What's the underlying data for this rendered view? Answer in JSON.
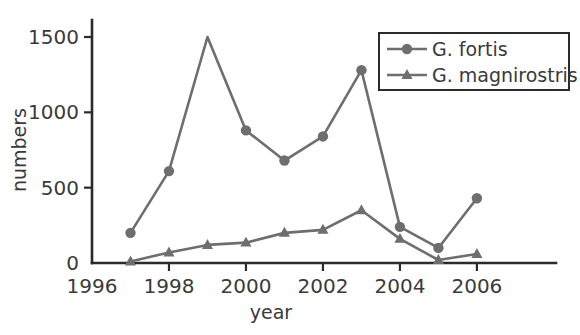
{
  "chart_data": {
    "type": "line",
    "title": "",
    "xlabel": "year",
    "ylabel": "numbers",
    "x": [
      1997,
      1998,
      1999,
      2000,
      2001,
      2002,
      2003,
      2004,
      2005,
      2006
    ],
    "xlim": [
      1996,
      2006.6
    ],
    "ylim": [
      0,
      1600
    ],
    "xticks": [
      1996,
      1998,
      2000,
      2002,
      2004,
      2006
    ],
    "xticklabels": [
      "1996",
      "1998",
      "2000",
      "2002",
      "2004",
      "2006"
    ],
    "yticks": [
      0,
      500,
      1000,
      1500
    ],
    "yticklabels": [
      "0",
      "500",
      "1000",
      "1500"
    ],
    "grid": false,
    "legend_position": "upper right",
    "series": [
      {
        "name": "G. fortis",
        "marker": "circle",
        "color": "#6e6e6e",
        "values": [
          200,
          610,
          1500,
          880,
          680,
          840,
          1280,
          240,
          100,
          430
        ]
      },
      {
        "name": "G. magnirostris",
        "marker": "triangle",
        "color": "#6e6e6e",
        "values": [
          10,
          70,
          120,
          135,
          200,
          220,
          350,
          160,
          20,
          60
        ]
      }
    ]
  },
  "legend": {
    "entries": [
      {
        "label": "G. fortis"
      },
      {
        "label": "G. magnirostris"
      }
    ]
  },
  "axes": {
    "x_title": "year",
    "y_title": "numbers"
  }
}
